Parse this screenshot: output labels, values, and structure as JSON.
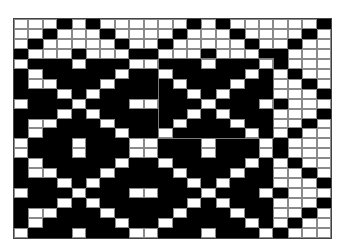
{
  "pattern": {
    "cols": 22,
    "rows": 22,
    "colors": {
      "filled": "#000000",
      "empty": "#ffffff",
      "frame": "#7a7a7a"
    },
    "grid": [
      "WWWBWBWWWWWWBWBWWWWWWB",
      "WWBWWWBWWWWBWWWBWWWWBW",
      "WBWWWWWBWWBWWWWWBWWBWW",
      "BWWWBWWWBBWWWBWWWBBWWW",
      "WBBBWBBBWWBBBWBBBWBWWW",
      "BWBBBBBWBBWBBBBBWBWBWW",
      "BWWBBBWBBBBWBBBWBBWWBW",
      "BBBWBWBBBBBBWBWBBBWWWB",
      "WBBBWBBBWWBBBWBBBWBWWW",
      "BBBWBWBBBBBBWBWBBBWWWB",
      "BWWBBBWBBBBWBBBWBBWWBW",
      "BWBBBBBWBBWBBBBBWBWBWW",
      "WBBBWBBBWWBBBWBBBWBWWW",
      "WBBBWBBBWWBBBWBBBWBWWW",
      "BWBBBBBWBBWBBBBBWBWBWW",
      "BWWBBBWBBBBWBBBWBBWWBW",
      "BBBWBWBBBBBBWBWBBBWWWB",
      "WBBBWBBBWWBBBWBBBWBWWW",
      "BBBWBWBBBBBBWBWBBBWWWB",
      "BWWBBBWBBBBWBBBWBBWWBW",
      "BWBBBBBWBBWBBBBBWBWBWW",
      "WBBBWBBBWWBBBWBBBWBWWW"
    ],
    "selection": {
      "col_start": 10,
      "col_end": 17,
      "row_start": 4,
      "row_end": 11
    }
  }
}
